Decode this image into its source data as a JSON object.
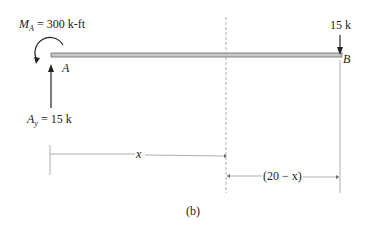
{
  "diagram": {
    "moment_label": {
      "symbol": "M",
      "subscript": "A",
      "value": "= 300 k-ft"
    },
    "point_a": "A",
    "point_b": "B",
    "load_b": "15 k",
    "reaction_label": {
      "symbol": "A",
      "subscript": "y",
      "value": "= 15 k"
    },
    "dim_x": "x",
    "dim_remaining": "(20 − x)",
    "caption": "(b)"
  },
  "colors": {
    "beam_fill": "#c8c8c8",
    "beam_edge": "#666666",
    "line": "#333333",
    "dashed": "#999999"
  }
}
